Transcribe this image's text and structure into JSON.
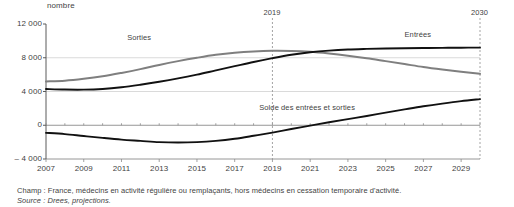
{
  "chart_data": {
    "type": "line",
    "title": "",
    "subtitle": "",
    "unit_label": "nombre",
    "xlabel": "",
    "ylabel": "nombre",
    "xlim": [
      2007,
      2030
    ],
    "ylim": [
      -4000,
      12000
    ],
    "grid": "horizontal",
    "legend_position": "inline-annotations",
    "yticks": [
      "12 000",
      "8 000",
      "4 000",
      "0",
      "– 4 000"
    ],
    "ytick_values": [
      12000,
      8000,
      4000,
      0,
      -4000
    ],
    "xticks": [
      "2007",
      "2009",
      "2011",
      "2013",
      "2015",
      "2017",
      "2019",
      "2021",
      "2023",
      "2025",
      "2027",
      "2029"
    ],
    "xtick_values": [
      2007,
      2009,
      2011,
      2013,
      2015,
      2017,
      2019,
      2021,
      2023,
      2025,
      2027,
      2029
    ],
    "x": [
      2007,
      2008,
      2009,
      2010,
      2011,
      2012,
      2013,
      2014,
      2015,
      2016,
      2017,
      2018,
      2019,
      2020,
      2021,
      2022,
      2023,
      2024,
      2025,
      2026,
      2027,
      2028,
      2029,
      2030
    ],
    "series": [
      {
        "name": "Sorties",
        "color": "#7f7f7f",
        "values": [
          5200,
          5280,
          5500,
          5800,
          6200,
          6650,
          7150,
          7600,
          8000,
          8350,
          8600,
          8750,
          8820,
          8800,
          8700,
          8500,
          8250,
          7950,
          7600,
          7250,
          6900,
          6600,
          6330,
          6100
        ]
      },
      {
        "name": "Entrées",
        "color": "#111111",
        "values": [
          4300,
          4230,
          4220,
          4300,
          4500,
          4800,
          5150,
          5550,
          6000,
          6500,
          7000,
          7500,
          7950,
          8350,
          8650,
          8850,
          8980,
          9050,
          9100,
          9130,
          9150,
          9170,
          9190,
          9200
        ]
      },
      {
        "name": "Solde des entrées et sorties",
        "color": "#111111",
        "values": [
          -900,
          -1050,
          -1280,
          -1500,
          -1700,
          -1850,
          -2000,
          -2050,
          -2000,
          -1850,
          -1600,
          -1250,
          -870,
          -450,
          -50,
          350,
          730,
          1100,
          1500,
          1880,
          2250,
          2570,
          2860,
          3100
        ]
      }
    ],
    "annotations": [
      {
        "name": "Sorties",
        "text": "Sorties",
        "x": 2011.3,
        "y": 10400
      },
      {
        "name": "Entrées",
        "text": "Entrées",
        "x": 2026.0,
        "y": 10700
      },
      {
        "name": "Solde des entrées et sorties",
        "text": "Solde des entrées et sorties",
        "x": 2018.3,
        "y": 2100
      }
    ],
    "vertical_markers": [
      {
        "label": "2019",
        "x": 2019
      },
      {
        "label": "2030",
        "x": 2030
      }
    ]
  },
  "footnotes": {
    "champ_lead": "Champ : ",
    "champ_text": "France, médecins en activité régulière ou remplaçants, hors médecins en cessation temporaire d'activité.",
    "source_lead": "Source : ",
    "source_text": "Drees, projections."
  }
}
